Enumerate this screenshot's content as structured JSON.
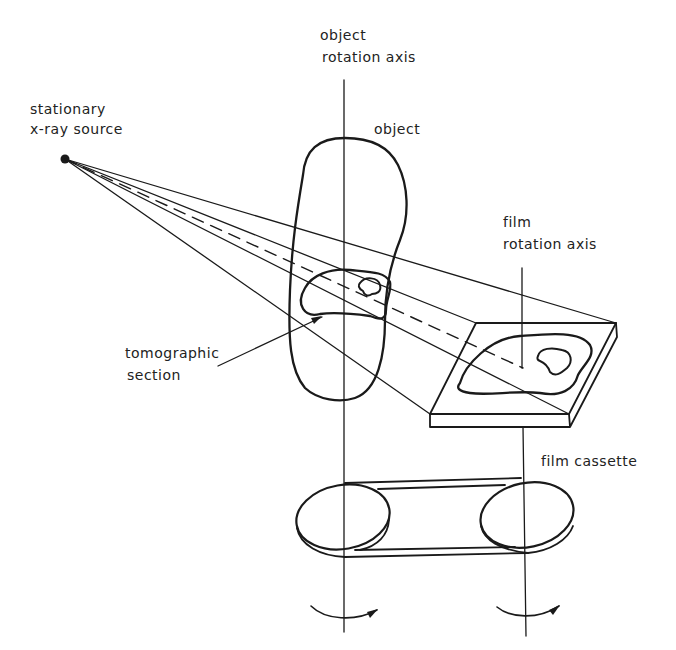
{
  "diagram": {
    "type": "technical illustration",
    "labels": {
      "source_line1": "stationary",
      "source_line2": "x-ray source",
      "object_axis_line1": "object",
      "object_axis_line2": "rotation axis",
      "object": "object",
      "film_axis_line1": "film",
      "film_axis_line2": "rotation axis",
      "section_line1": "tomographic",
      "section_line2": "section",
      "cassette": "film cassette"
    },
    "colors": {
      "ink": "#1a1a1a",
      "background": "#ffffff"
    }
  }
}
